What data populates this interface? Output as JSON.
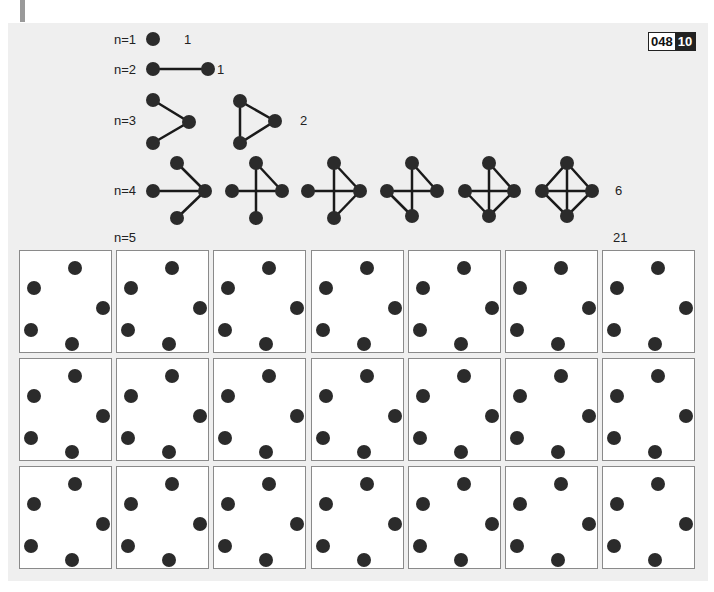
{
  "header": {
    "badge_left": "048",
    "badge_right": "10"
  },
  "rows": [
    {
      "label": "n=1",
      "count": "1"
    },
    {
      "label": "n=2",
      "count": "1"
    },
    {
      "label": "n=3",
      "count": "2"
    },
    {
      "label": "n=4",
      "count": "6"
    },
    {
      "label": "n=5",
      "count": "21"
    }
  ],
  "grid": {
    "rows": 3,
    "cols": 7,
    "points_per_cell": 5,
    "description": "21 empty five-vertex layouts"
  },
  "colors": {
    "node": "#2b2b2b",
    "panel": "#efefef",
    "badge_dark": "#222222"
  }
}
